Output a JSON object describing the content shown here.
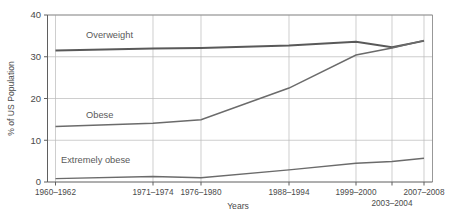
{
  "chart_data": {
    "type": "line",
    "title": "",
    "subtitle": "",
    "xlabel": "Years",
    "ylabel": "% of US Population",
    "grid": true,
    "legend_position": "inline-labels",
    "ylim": [
      0,
      40
    ],
    "yticks": [
      "0",
      "10",
      "20",
      "30",
      "40"
    ],
    "ytick_values": [
      0,
      10,
      20,
      30,
      40
    ],
    "categories": [
      "1960–1962",
      "1971–1974",
      "1976–1980",
      "1988–1994",
      "1999–2000",
      "2003–2004",
      "2007–2008"
    ],
    "xtick_labels": [
      {
        "text": "1960–1962",
        "row": 0
      },
      {
        "text": "1971–1974",
        "row": 0
      },
      {
        "text": "1976–1980",
        "row": 0
      },
      {
        "text": "1988–1994",
        "row": 0
      },
      {
        "text": "1999–2000",
        "row": 0
      },
      {
        "text": "2003–2004",
        "row": 1
      },
      {
        "text": "2007–2008",
        "row": 0
      }
    ],
    "series": [
      {
        "name": "Overweight",
        "label": "Overweight",
        "color": "#595959",
        "values": [
          31.5,
          32.0,
          32.1,
          32.7,
          33.6,
          32.3,
          33.8
        ]
      },
      {
        "name": "Obese",
        "label": "Obese",
        "color": "#6b6b6b",
        "values": [
          13.3,
          14.1,
          14.9,
          22.5,
          30.4,
          32.1,
          33.9
        ]
      },
      {
        "name": "Extremely obese",
        "label": "Extremely obese",
        "color": "#6b6b6b",
        "values": [
          0.8,
          1.3,
          1.0,
          2.9,
          4.5,
          4.9,
          5.7
        ]
      }
    ],
    "annotations": [
      {
        "name": "overweight-label",
        "text": "Overweight"
      },
      {
        "name": "obese-label",
        "text": "Obese"
      },
      {
        "name": "extremely-obese-label",
        "text": "Extremely obese"
      }
    ],
    "colors": {
      "background": "#ffffff",
      "grid": "#b9b9b9",
      "axis": "#5f5f5f",
      "text": "#4a4a4a",
      "line": "#5f5f5f"
    }
  }
}
